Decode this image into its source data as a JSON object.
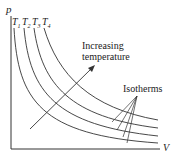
{
  "axes": {
    "y_label": "p",
    "x_label": "V"
  },
  "isotherms": [
    {
      "label": "T",
      "sub": "1"
    },
    {
      "label": "T",
      "sub": "2"
    },
    {
      "label": "T",
      "sub": "3"
    },
    {
      "label": "T",
      "sub": "4"
    }
  ],
  "annotations": {
    "arrow_label_line1": "Increasing",
    "arrow_label_line2": "temperature",
    "isotherms_label": "Isotherms"
  },
  "colors": {
    "line": "#333333",
    "text": "#222222"
  }
}
